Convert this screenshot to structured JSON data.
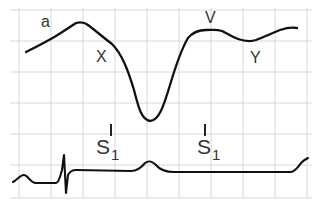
{
  "diagram": {
    "grid": {
      "color": "#d8d8d8",
      "x_lines": [
        19,
        51,
        83,
        115,
        147,
        179,
        211,
        243,
        275,
        307
      ],
      "y_lines": [
        10,
        41,
        72,
        103,
        134,
        165,
        198
      ]
    },
    "trace_color": "#111111",
    "labels": {
      "a": "a",
      "x": "X",
      "v": "V",
      "y": "Y",
      "s1_first": "S",
      "s1_first_sub": "1",
      "s1_second": "S",
      "s1_second_sub": "1"
    }
  }
}
